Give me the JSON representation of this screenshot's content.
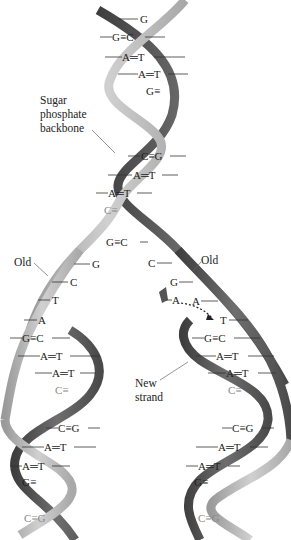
{
  "labels": {
    "backbone": [
      "Sugar",
      "phosphate",
      "backbone"
    ],
    "old_left": "Old",
    "old_right": "Old",
    "new_strand": [
      "New",
      "strand"
    ]
  },
  "colors": {
    "light_strand": "#b8b8b8",
    "dark_strand": "#5a5a5a",
    "text": "#222222",
    "background": "#ffffff"
  },
  "parent_helix_pairs": [
    "G",
    "G≡C",
    "A═T",
    "A═T",
    "G≡",
    "C≡G",
    "A═T",
    "A═T",
    "C≡",
    "G≡C"
  ],
  "fork": {
    "left_unpaired": [
      "G",
      "C",
      "T",
      "A"
    ],
    "right_unpaired": [
      "C",
      "G",
      "A",
      "T"
    ],
    "incoming_nucleotide": "A"
  },
  "left_daughter_pairs": [
    "G≡C",
    "A═T",
    "A═T",
    "C≡",
    "C≡G",
    "A═T",
    "A═T",
    "G≡",
    "C≡G"
  ],
  "right_daughter_pairs": [
    "G≡C",
    "A═T",
    "A═T",
    "C≡",
    "C≡G",
    "A═T",
    "A═T",
    "G≡",
    "C≡G"
  ]
}
